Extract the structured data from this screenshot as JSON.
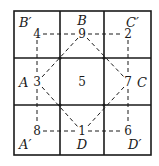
{
  "diagram": {
    "grid": {
      "rows": 3,
      "cols": 3
    },
    "region_labels": {
      "top_left": "B′",
      "top_middle": "B",
      "top_right": "C′",
      "middle_left": "A",
      "middle_right": "C",
      "bottom_left": "A′",
      "bottom_middle": "D",
      "bottom_right": "D′"
    },
    "numbers": {
      "corner_top_left": "4",
      "top_middle": "9",
      "corner_top_right": "2",
      "middle_left": "3",
      "center": "5",
      "middle_right": "7",
      "corner_bottom_left": "8",
      "bottom_middle": "1",
      "corner_bottom_right": "6"
    },
    "colors": {
      "line": "#1a1a1a",
      "background": "#ffffff"
    }
  }
}
